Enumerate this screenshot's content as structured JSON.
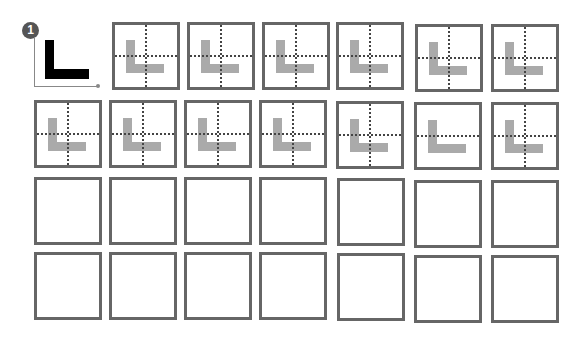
{
  "example": {
    "badge_number": "1",
    "letter": "L",
    "icons": [
      "number-badge-icon",
      "axis-arrow-icon",
      "letter-l-icon"
    ]
  },
  "colors": {
    "box_border": "#666666",
    "ghost_letter": "#aaaaaa",
    "guide_lines": "#444444",
    "example_letter": "#000000",
    "badge": "#555555"
  },
  "grid": {
    "rows": [
      {
        "boxes": [
          {
            "x": 112,
            "y": 22,
            "traced": true,
            "v_guide": true,
            "h_guide": true
          },
          {
            "x": 187,
            "y": 22,
            "traced": true,
            "v_guide": true,
            "h_guide": true
          },
          {
            "x": 262,
            "y": 22,
            "traced": true,
            "v_guide": true,
            "h_guide": true
          },
          {
            "x": 336,
            "y": 22,
            "traced": true,
            "v_guide": true,
            "h_guide": true
          },
          {
            "x": 415,
            "y": 24,
            "traced": true,
            "v_guide": true,
            "h_guide": true
          },
          {
            "x": 491,
            "y": 24,
            "traced": true,
            "v_guide": true,
            "h_guide": true
          }
        ]
      },
      {
        "boxes": [
          {
            "x": 34,
            "y": 100,
            "traced": true,
            "v_guide": true,
            "h_guide": true
          },
          {
            "x": 109,
            "y": 100,
            "traced": true,
            "v_guide": true,
            "h_guide": true
          },
          {
            "x": 184,
            "y": 100,
            "traced": true,
            "v_guide": true,
            "h_guide": true
          },
          {
            "x": 259,
            "y": 100,
            "traced": true,
            "v_guide": true,
            "h_guide": true
          },
          {
            "x": 336,
            "y": 101,
            "traced": true,
            "v_guide": true,
            "h_guide": true
          },
          {
            "x": 414,
            "y": 102,
            "traced": true,
            "v_guide": false,
            "h_guide": true
          },
          {
            "x": 491,
            "y": 102,
            "traced": true,
            "v_guide": true,
            "h_guide": true
          }
        ]
      },
      {
        "boxes": [
          {
            "x": 34,
            "y": 177,
            "traced": false
          },
          {
            "x": 109,
            "y": 177,
            "traced": false
          },
          {
            "x": 184,
            "y": 177,
            "traced": false
          },
          {
            "x": 259,
            "y": 177,
            "traced": false
          },
          {
            "x": 337,
            "y": 178,
            "traced": false
          },
          {
            "x": 414,
            "y": 180,
            "traced": false
          },
          {
            "x": 491,
            "y": 180,
            "traced": false
          }
        ]
      },
      {
        "boxes": [
          {
            "x": 34,
            "y": 252,
            "traced": false
          },
          {
            "x": 109,
            "y": 252,
            "traced": false
          },
          {
            "x": 184,
            "y": 252,
            "traced": false
          },
          {
            "x": 259,
            "y": 252,
            "traced": false
          },
          {
            "x": 337,
            "y": 253,
            "traced": false
          },
          {
            "x": 414,
            "y": 255,
            "traced": false
          },
          {
            "x": 491,
            "y": 255,
            "traced": false
          }
        ]
      }
    ]
  }
}
